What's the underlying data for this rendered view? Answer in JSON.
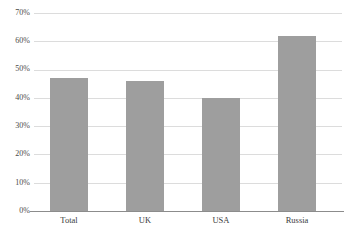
{
  "chart_data": {
    "type": "bar",
    "title": "",
    "subtitle": "",
    "xlabel": "",
    "ylabel": "",
    "categories": [
      "Total",
      "UK",
      "USA",
      "Russia"
    ],
    "values": [
      47,
      46,
      40,
      62
    ],
    "value_suffix": "%",
    "ylim": [
      0,
      70
    ],
    "ytick_values": [
      70,
      60,
      50,
      40,
      30,
      20,
      10,
      0
    ],
    "ytick_labels": [
      "70%",
      "60%",
      "50%",
      "40%",
      "30%",
      "20%",
      "10%",
      "0%"
    ],
    "grid": true,
    "legend": false,
    "legend_position": "none",
    "series": [
      {
        "name": "",
        "values": [
          47,
          46,
          40,
          62
        ]
      }
    ]
  },
  "style": {
    "bar_color": "#9e9e9e",
    "gridline_color": "#dcdcdc",
    "axis_color": "#8c8c8c",
    "text_color": "#3b3b3b",
    "background": "#ffffff"
  },
  "header": {
    "clipped_title": ""
  }
}
